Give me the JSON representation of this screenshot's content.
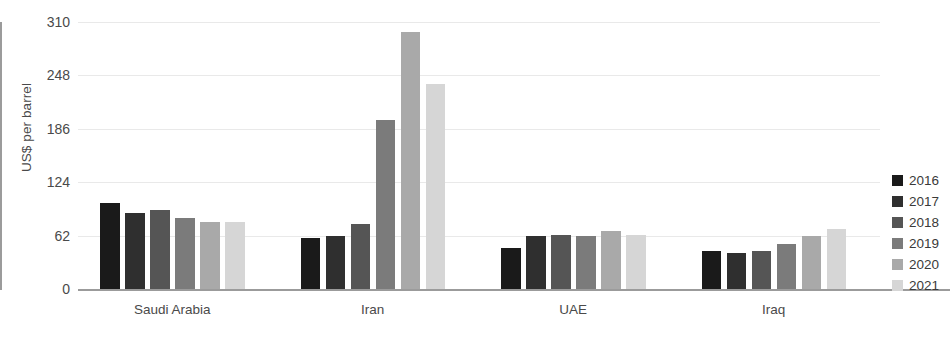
{
  "chart_data": {
    "type": "bar",
    "title": "",
    "subtitle": "",
    "xlabel": "",
    "ylabel": "US$ per barrel",
    "categories": [
      "Saudi Arabia",
      "Iran",
      "UAE",
      "Iraq"
    ],
    "series": [
      {
        "name": "2016",
        "color": "#1a1a1a",
        "values": [
          100,
          59,
          48,
          44
        ]
      },
      {
        "name": "2017",
        "color": "#2f2f2f",
        "values": [
          88,
          62,
          61,
          42
        ]
      },
      {
        "name": "2018",
        "color": "#555555",
        "values": [
          92,
          75,
          63,
          44
        ]
      },
      {
        "name": "2019",
        "color": "#7b7b7b",
        "values": [
          83,
          196,
          61,
          52
        ]
      },
      {
        "name": "2020",
        "color": "#a9a9a9",
        "values": [
          78,
          298,
          67,
          62
        ]
      },
      {
        "name": "2021",
        "color": "#d6d6d6",
        "values": [
          78,
          238,
          63,
          70
        ]
      }
    ],
    "ylim": [
      0,
      310
    ],
    "yticks": [
      0,
      62,
      124,
      186,
      248,
      310
    ],
    "ytick_labels": [
      "0",
      "62",
      "124",
      "186",
      "248",
      "310"
    ],
    "grid": true,
    "grid_axis": "y",
    "legend_position": "right",
    "legend_entries": [
      "2016",
      "2017",
      "2018",
      "2019",
      "2020",
      "2021"
    ],
    "annotations": []
  },
  "style": {
    "background": "#ffffff",
    "axis_color": "#9b9b9b",
    "grid_color": "#e9e9e9",
    "text_color": "#4a4a4a"
  }
}
